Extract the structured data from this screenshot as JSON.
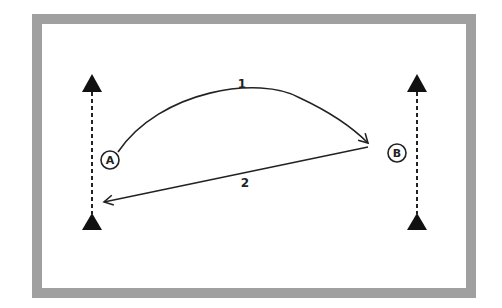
{
  "diagram": {
    "colors": {
      "frame_border": "#a0a0a0",
      "stroke": "#222222",
      "background": "#ffffff"
    },
    "nodes": [
      {
        "id": "A",
        "label": "A"
      },
      {
        "id": "B",
        "label": "B"
      }
    ],
    "paths": [
      {
        "id": "1",
        "label": "1",
        "from": "A",
        "to": "B",
        "style": "curved-solid-arrow"
      },
      {
        "id": "2",
        "label": "2",
        "from": "B",
        "to": "left-line",
        "style": "straight-solid-arrow"
      }
    ],
    "markers": [
      {
        "name": "left-top-cone",
        "shape": "triangle"
      },
      {
        "name": "left-bottom-cone",
        "shape": "triangle"
      },
      {
        "name": "right-top-cone",
        "shape": "triangle"
      },
      {
        "name": "right-bottom-cone",
        "shape": "triangle"
      }
    ],
    "guide_lines": [
      {
        "name": "left-dashed-line",
        "style": "dashed-arrow-up"
      },
      {
        "name": "right-dashed-line",
        "style": "dashed-arrow-up"
      }
    ]
  }
}
